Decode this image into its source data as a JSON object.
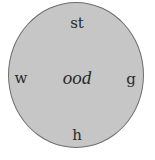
{
  "diagram": {
    "type": "word-wheel",
    "center": "ood",
    "prefixes": {
      "top": "st",
      "left": "w",
      "right": "g",
      "bottom": "h"
    },
    "colors": {
      "fill": "#c6c6c6",
      "border": "#6e6e6e",
      "text": "#2a2a2a"
    }
  }
}
